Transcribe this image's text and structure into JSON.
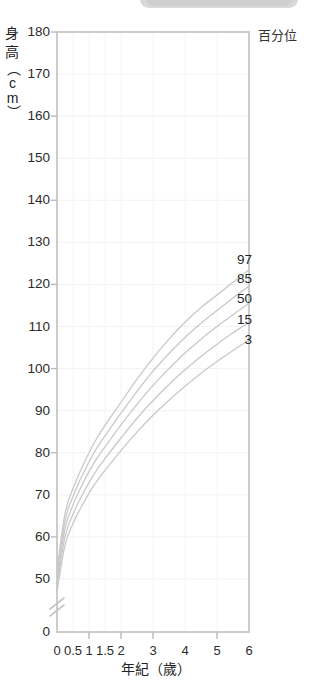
{
  "header": {
    "partial_pill": "cut-off-toolbar-pill"
  },
  "axis": {
    "y_title_lines": [
      "身",
      "高",
      "（cm）"
    ],
    "y_title_full": "身高（cm）",
    "x_title": "年紀（歲）",
    "legend_title": "百分位"
  },
  "chart_data": {
    "type": "line",
    "title": "",
    "subtitle": "",
    "xlabel": "年紀（歲）",
    "ylabel": "身高（cm）",
    "legend_title": "百分位",
    "legend_position": "right-inline-at-curve-ends",
    "grid": true,
    "axis_break": {
      "axis": "y",
      "symbol": "double-slash",
      "between": [
        0,
        45
      ]
    },
    "ylim": [
      0,
      180
    ],
    "yticks": [
      0,
      50,
      60,
      70,
      80,
      90,
      100,
      110,
      120,
      130,
      140,
      150,
      160,
      170,
      180
    ],
    "ytick_labels": [
      "0",
      "50",
      "60",
      "70",
      "80",
      "90",
      "100",
      "110",
      "120",
      "130",
      "140",
      "150",
      "160",
      "170",
      "180"
    ],
    "xlim": [
      0,
      6
    ],
    "xticks": [
      0,
      0.5,
      1,
      1.5,
      2,
      3,
      4,
      5,
      6
    ],
    "xtick_labels": [
      "0",
      "0.5",
      "1",
      "1.5",
      "2",
      "3",
      "4",
      "5",
      "6"
    ],
    "x": [
      0,
      0.25,
      0.5,
      0.75,
      1,
      1.25,
      1.5,
      2,
      2.5,
      3,
      3.5,
      4,
      4.5,
      5,
      5.5,
      6
    ],
    "series": [
      {
        "name": "97",
        "label": "97",
        "color": "#c9c9c9",
        "values": [
          52.0,
          65.5,
          71.5,
          76.0,
          80.0,
          83.5,
          86.5,
          92.0,
          97.5,
          102.5,
          107.0,
          111.0,
          114.5,
          117.5,
          120.5,
          123.5
        ]
      },
      {
        "name": "85",
        "label": "85",
        "color": "#c9c9c9",
        "values": [
          50.8,
          63.8,
          69.6,
          74.0,
          77.8,
          81.2,
          84.0,
          89.4,
          94.6,
          99.4,
          103.6,
          107.4,
          110.8,
          113.8,
          116.8,
          119.6
        ]
      },
      {
        "name": "50",
        "label": "50",
        "color": "#c9c9c9",
        "values": [
          49.6,
          62.0,
          67.6,
          71.8,
          75.5,
          78.7,
          81.4,
          86.6,
          91.5,
          96.0,
          100.0,
          103.7,
          107.0,
          110.0,
          112.8,
          115.5
        ]
      },
      {
        "name": "15",
        "label": "15",
        "color": "#c9c9c9",
        "values": [
          48.3,
          60.0,
          65.4,
          69.4,
          72.9,
          76.0,
          78.6,
          83.5,
          88.2,
          92.4,
          96.2,
          99.7,
          102.9,
          105.8,
          108.5,
          111.0
        ]
      },
      {
        "name": "3",
        "label": "3",
        "color": "#c9c9c9",
        "values": [
          47.0,
          58.0,
          63.2,
          67.0,
          70.4,
          73.3,
          75.8,
          80.5,
          84.9,
          88.9,
          92.5,
          95.8,
          98.9,
          101.7,
          104.3,
          106.8
        ]
      }
    ]
  },
  "percentile_labels": [
    {
      "text": "97",
      "top": 252
    },
    {
      "text": "85",
      "top": 271
    },
    {
      "text": "50",
      "top": 291
    },
    {
      "text": "15",
      "top": 312
    },
    {
      "text": "3",
      "top": 332
    }
  ]
}
